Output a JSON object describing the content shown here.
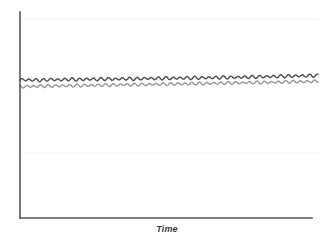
{
  "figure": {
    "width": 328,
    "height": 245,
    "background": "#ffffff"
  },
  "axes": {
    "color": "#575757",
    "line_width": 1.6,
    "x_axis": {
      "x1": 20,
      "y1": 218,
      "x2": 312,
      "y2": 218
    },
    "y_axis": {
      "x1": 20,
      "y1": 12,
      "x2": 20,
      "y2": 218
    },
    "x_label": "Time",
    "y_label": "",
    "tick_labels_x": [],
    "tick_labels_y": []
  },
  "gridlines": {
    "visible": true,
    "color": "#f2f2f2",
    "horizontal_y": [
      19,
      153
    ]
  },
  "chart_data": {
    "type": "line",
    "title": "",
    "subtitle": "",
    "xlabel": "Time",
    "ylabel": "",
    "grid": true,
    "legend": "none",
    "xlim": [
      0,
      1
    ],
    "ylim": [
      0,
      1
    ],
    "x_axis_ticks": false,
    "y_axis_ticks": false,
    "annotations": [],
    "series": [
      {
        "name": "series-upper",
        "color": "#555555",
        "line_width": 1.5,
        "baseline_start": 0.669,
        "baseline_end": 0.693,
        "amplitude": 0.011,
        "period_px": 7.2,
        "phase": 0.0,
        "x_start_px": 20,
        "x_end_px": 318,
        "values": [
          0.669,
          0.673,
          0.668,
          0.672,
          0.667,
          0.671,
          0.67,
          0.674,
          0.669,
          0.673,
          0.671,
          0.675,
          0.67,
          0.674,
          0.672,
          0.676,
          0.671,
          0.676,
          0.673,
          0.677,
          0.672,
          0.677,
          0.674,
          0.678,
          0.673,
          0.678,
          0.675,
          0.68,
          0.675,
          0.68,
          0.676,
          0.681,
          0.676,
          0.681,
          0.677,
          0.682,
          0.677,
          0.683,
          0.678,
          0.683,
          0.679,
          0.684,
          0.679,
          0.685,
          0.68,
          0.685,
          0.681,
          0.686,
          0.682,
          0.687,
          0.683,
          0.688,
          0.684,
          0.689,
          0.685,
          0.69,
          0.686,
          0.691,
          0.687,
          0.692,
          0.688,
          0.693,
          0.689,
          0.693
        ]
      },
      {
        "name": "series-lower",
        "color": "#9b9b9b",
        "line_width": 1.5,
        "baseline_start": 0.639,
        "baseline_end": 0.664,
        "amplitude": 0.01,
        "period_px": 7.2,
        "phase": 2.1,
        "x_start_px": 20,
        "x_end_px": 318,
        "values": [
          0.639,
          0.636,
          0.641,
          0.637,
          0.642,
          0.638,
          0.643,
          0.639,
          0.643,
          0.64,
          0.644,
          0.64,
          0.645,
          0.641,
          0.646,
          0.642,
          0.646,
          0.643,
          0.647,
          0.643,
          0.648,
          0.644,
          0.649,
          0.645,
          0.649,
          0.646,
          0.65,
          0.646,
          0.651,
          0.647,
          0.652,
          0.648,
          0.652,
          0.649,
          0.653,
          0.649,
          0.654,
          0.65,
          0.655,
          0.651,
          0.655,
          0.652,
          0.656,
          0.653,
          0.657,
          0.654,
          0.658,
          0.654,
          0.659,
          0.655,
          0.66,
          0.656,
          0.66,
          0.657,
          0.661,
          0.658,
          0.662,
          0.659,
          0.663,
          0.66,
          0.663,
          0.661,
          0.664,
          0.664
        ]
      }
    ]
  }
}
